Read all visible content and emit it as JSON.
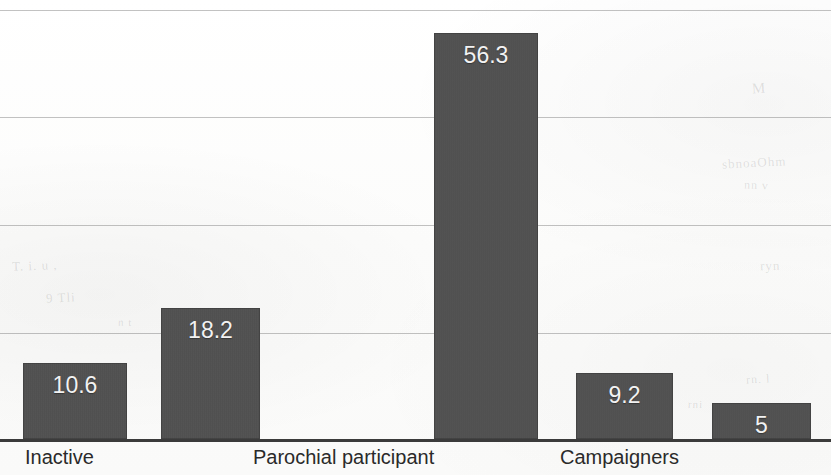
{
  "chart_data": {
    "type": "bar",
    "title": "",
    "subtitle": "",
    "xlabel": "",
    "ylabel": "",
    "grid": true,
    "legend": "none",
    "ylim": [
      0,
      62
    ],
    "gridline_values": [
      60,
      45,
      30,
      15
    ],
    "categories": [
      "Inactive",
      "",
      "Parochial participant",
      "Campaigners",
      ""
    ],
    "visible_tick_labels": [
      "Inactive",
      "Parochial participant",
      "Campaigners"
    ],
    "values": [
      10.6,
      18.2,
      56.3,
      9.2,
      5
    ],
    "value_labels": [
      "10.6",
      "18.2",
      "56.3",
      "9.2",
      "5"
    ],
    "bar_color": "#4f4f4f",
    "value_label_color": "#f2f2f2",
    "gridline_color": "#787878",
    "axis_color": "#3b3b3b",
    "bars": [
      {
        "name": "bar-inactive",
        "label": "10.6",
        "value": 10.6,
        "x": 23,
        "width": 104
      },
      {
        "name": "bar-second",
        "label": "18.2",
        "value": 18.2,
        "x": 161,
        "width": 99
      },
      {
        "name": "bar-parochial",
        "label": "56.3",
        "value": 56.3,
        "x": 434,
        "width": 104
      },
      {
        "name": "bar-campaigners",
        "label": "9.2",
        "value": 9.2,
        "x": 576,
        "width": 97
      },
      {
        "name": "bar-last",
        "label": "5",
        "value": 5,
        "x": 712,
        "width": 99
      }
    ],
    "tick_labels": [
      {
        "name": "tick-label-inactive",
        "text": "Inactive",
        "x": 25
      },
      {
        "name": "tick-label-parochial",
        "text": "Parochial participant",
        "x": 253
      },
      {
        "name": "tick-label-campaigners",
        "text": "Campaigners",
        "x": 560
      }
    ]
  },
  "artifacts": {
    "ghosts": [
      {
        "text": "M",
        "x": 752,
        "y": 80,
        "size": 15,
        "rotate": -4
      },
      {
        "text": "sbnoaOhm",
        "x": 722,
        "y": 155,
        "size": 13,
        "rotate": -3
      },
      {
        "text": "nn  v",
        "x": 744,
        "y": 178,
        "size": 12,
        "rotate": 2
      },
      {
        "text": "ryn",
        "x": 760,
        "y": 258,
        "size": 13,
        "rotate": -2
      },
      {
        "text": "T. i.  u ,",
        "x": 12,
        "y": 258,
        "size": 13,
        "rotate": -2
      },
      {
        "text": "9 Tli",
        "x": 46,
        "y": 290,
        "size": 13,
        "rotate": -3
      },
      {
        "text": "n t",
        "x": 118,
        "y": 316,
        "size": 11,
        "rotate": 1
      },
      {
        "text": "mtro i",
        "x": 44,
        "y": 362,
        "size": 12,
        "rotate": -2
      },
      {
        "text": "rn. l",
        "x": 746,
        "y": 372,
        "size": 12,
        "rotate": -3
      },
      {
        "text": "rni",
        "x": 688,
        "y": 398,
        "size": 11,
        "rotate": 2
      }
    ]
  }
}
